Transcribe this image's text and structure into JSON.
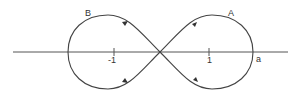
{
  "diagram": {
    "labels": {
      "loop_right": "A",
      "loop_left": "B",
      "tick_neg": "-1",
      "tick_pos": "1",
      "intercept": "a"
    },
    "colors": {
      "curve": "#444444",
      "axis": "#555555",
      "background": "#ffffff"
    }
  }
}
